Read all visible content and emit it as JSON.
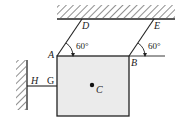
{
  "diagram": {
    "labels": {
      "D": "D",
      "E": "E",
      "A": "A",
      "B": "B",
      "C": "C",
      "G": "G",
      "H": "H"
    },
    "angles": {
      "at_A": "60°",
      "at_B": "60°"
    },
    "colors": {
      "line": "#222222",
      "block_fill": "#ebebeb"
    }
  }
}
